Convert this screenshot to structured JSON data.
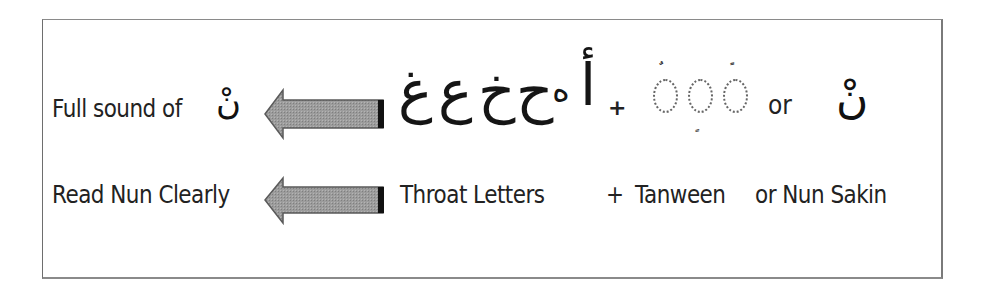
{
  "diagram": {
    "title_row": {
      "left_label": "Full sound of",
      "left_symbol": "نْ",
      "arrow_direction": "left",
      "throat_letters_visual_ltr": [
        "غ",
        "ع",
        "خ",
        "ح",
        "ه",
        "أ"
      ],
      "throat_letters_logical": [
        "أ",
        "ه",
        "ح",
        "خ",
        "ع",
        "غ"
      ],
      "plus": "+",
      "tanween_marks": [
        {
          "position": "above",
          "mark": "ٌ",
          "name": "dammatain"
        },
        {
          "position": "below",
          "mark": "ٍ",
          "name": "kasratain"
        },
        {
          "position": "above",
          "mark": "ً",
          "name": "fathatain"
        }
      ],
      "or": "or",
      "right_symbol": "نْ"
    },
    "explanation_row": {
      "left_label": "Read Nun Clearly",
      "arrow_direction": "left",
      "throat_label": "Throat Letters",
      "plus": "+",
      "tanween_label": "Tanween",
      "nun_sakin_label": "or Nun Sakin"
    },
    "colors": {
      "arrow_fill": "#9a9a9a",
      "arrow_edge": "#555555",
      "arrow_tail": "#111111",
      "border": "#7a7a7a",
      "text": "#222222",
      "dotted_circle": "#666666"
    }
  }
}
